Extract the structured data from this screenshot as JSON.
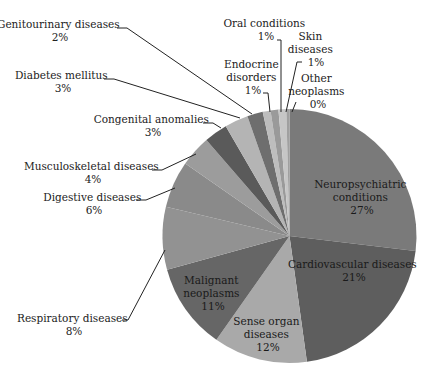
{
  "chart_data": {
    "type": "pie",
    "title": "",
    "start_angle_deg": 0,
    "direction": "clockwise",
    "slices": [
      {
        "label": "Neuropsychiatric conditions",
        "value": 27,
        "pct_label": "27%",
        "color": "#7a7a7a",
        "label_lines": [
          "Neuropsychiatric",
          "conditions",
          "27%"
        ],
        "label_pos": "inside"
      },
      {
        "label": "Cardiovascular diseases",
        "value": 21,
        "pct_label": "21%",
        "color": "#5e5e5e",
        "label_lines": [
          "Cardiovascular diseases",
          "21%"
        ],
        "label_pos": "inside"
      },
      {
        "label": "Sense organ diseases",
        "value": 12,
        "pct_label": "12%",
        "color": "#a9a9a9",
        "label_lines": [
          "Sense organ",
          "diseases",
          "12%"
        ],
        "label_pos": "inside"
      },
      {
        "label": "Malignant neoplasms",
        "value": 11,
        "pct_label": "11%",
        "color": "#666666",
        "label_lines": [
          "Malignant",
          "neoplasms",
          "11%"
        ],
        "label_pos": "inside"
      },
      {
        "label": "Respiratory diseases",
        "value": 8,
        "pct_label": "8%",
        "color": "#929292",
        "label_lines": [
          "Respiratory diseases",
          "8%"
        ],
        "label_pos": "outside"
      },
      {
        "label": "Digestive diseases",
        "value": 6,
        "pct_label": "6%",
        "color": "#8a8a8a",
        "label_lines": [
          "Digestive diseases",
          "6%"
        ],
        "label_pos": "outside"
      },
      {
        "label": "Musculoskeletal diseases",
        "value": 4,
        "pct_label": "4%",
        "color": "#9c9c9c",
        "label_lines": [
          "Musculoskeletal diseases",
          "4%"
        ],
        "label_pos": "outside"
      },
      {
        "label": "Congenital anomalies",
        "value": 3,
        "pct_label": "3%",
        "color": "#5a5a5a",
        "label_lines": [
          "Congenital anomalies",
          "3%"
        ],
        "label_pos": "outside"
      },
      {
        "label": "Diabetes mellitus",
        "value": 3,
        "pct_label": "3%",
        "color": "#b4b4b4",
        "label_lines": [
          "Diabetes mellitus",
          "3%"
        ],
        "label_pos": "outside"
      },
      {
        "label": "Genitourinary diseases",
        "value": 2,
        "pct_label": "2%",
        "color": "#6e6e6e",
        "label_lines": [
          "Genitourinary diseases",
          "2%"
        ],
        "label_pos": "outside"
      },
      {
        "label": "Endocrine disorders",
        "value": 1,
        "pct_label": "1%",
        "color": "#bdbdbd",
        "label_lines": [
          "Endocrine",
          "disorders",
          "1%"
        ],
        "label_pos": "outside"
      },
      {
        "label": "Oral conditions",
        "value": 1,
        "pct_label": "1%",
        "color": "#9a9a9a",
        "label_lines": [
          "Oral conditions",
          "1%"
        ],
        "label_pos": "outside"
      },
      {
        "label": "Skin diseases",
        "value": 1,
        "pct_label": "1%",
        "color": "#c6c6c6",
        "label_lines": [
          "Skin",
          "diseases",
          "1%"
        ],
        "label_pos": "outside"
      },
      {
        "label": "Other neoplasms",
        "value": 0.4,
        "pct_label": "0%",
        "color": "#a0a0a0",
        "label_lines": [
          "Other",
          "neoplasms",
          "0%"
        ],
        "label_pos": "outside"
      }
    ],
    "legend": "none",
    "data_labels": "category name and percentage"
  },
  "geometry": {
    "cx": 289.5,
    "cy": 236,
    "r": 127
  }
}
